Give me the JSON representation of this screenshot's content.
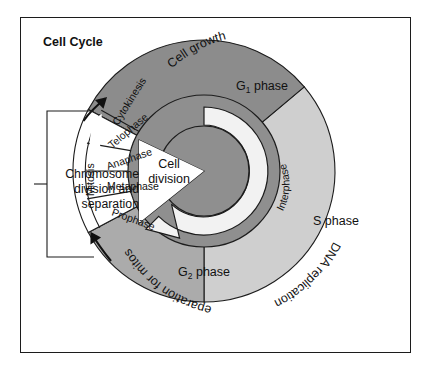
{
  "figure": {
    "title": "Cell Cycle",
    "background_color": "#ffffff",
    "frame_color": "#1c1c1c"
  },
  "colors": {
    "g1_phase": "#8c8c8c",
    "s_phase": "#cfcfcf",
    "g2_phase": "#ababab",
    "inner_disc": "#8f8f8f",
    "interphase_ring": "#8f8f8f",
    "arrow_ring": "#f2f2f2",
    "white_wedge": "#ffffff",
    "outline": "#1c1c1c"
  },
  "sectors": [
    {
      "id": "g1",
      "label": "G",
      "subscript": "1",
      "label_suffix": " phase",
      "outer_caption": "Cell growth"
    },
    {
      "id": "s",
      "label": "S phase",
      "subscript": "",
      "label_suffix": "",
      "outer_caption": "DNA replication"
    },
    {
      "id": "g2",
      "label": "G",
      "subscript": "2",
      "label_suffix": " phase",
      "outer_caption": "Preparation for mitosis"
    }
  ],
  "center": {
    "line1": "Cell",
    "line2": "division"
  },
  "interphase": {
    "label": "Interphase"
  },
  "mitosis": {
    "band_label": "Mitosis",
    "phases": [
      "Cytokinesis",
      "Telophase",
      "Anaphase",
      "Metaphase",
      "Prophase"
    ]
  },
  "bracket": {
    "line1": "Chromosome",
    "line2": "division and",
    "line3": "separation"
  },
  "chart_data": {
    "type": "pie",
    "title": "Cell Cycle",
    "categories": [
      "G1 phase",
      "S phase",
      "G2 phase",
      "Mitosis"
    ],
    "annotations": [
      "Cell growth",
      "DNA replication",
      "Preparation for mitosis",
      "Chromosome division and separation",
      "Interphase",
      "Cell division"
    ],
    "legend_position": "none",
    "grid": false
  }
}
